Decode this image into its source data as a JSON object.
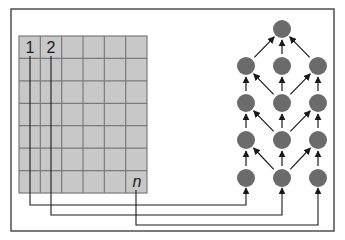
{
  "diagram": {
    "frame": {
      "x": 11,
      "y": 9,
      "w": 323,
      "h": 222,
      "stroke": "#333333"
    },
    "grid": {
      "x": 19,
      "y": 36,
      "w": 128,
      "h": 157,
      "cols": 6,
      "rows": 7,
      "fill": "#c8c8c8",
      "line_color": "#7a7a7a"
    },
    "labels": [
      {
        "text": "1",
        "x": 30,
        "y": 53,
        "italic": false
      },
      {
        "text": "2",
        "x": 51,
        "y": 53,
        "italic": false
      },
      {
        "text": "n",
        "x": 137,
        "y": 187,
        "italic": true
      }
    ],
    "node_color": "#6b6b6b",
    "node_radius": 9,
    "nodes": [
      {
        "id": "top",
        "x": 282,
        "y": 29
      },
      {
        "id": "r2c1",
        "x": 246,
        "y": 66
      },
      {
        "id": "r2c2",
        "x": 282,
        "y": 66
      },
      {
        "id": "r2c3",
        "x": 318,
        "y": 66
      },
      {
        "id": "r3c1",
        "x": 246,
        "y": 103
      },
      {
        "id": "r3c2",
        "x": 282,
        "y": 103
      },
      {
        "id": "r3c3",
        "x": 318,
        "y": 103
      },
      {
        "id": "r4c1",
        "x": 246,
        "y": 140
      },
      {
        "id": "r4c2",
        "x": 282,
        "y": 140
      },
      {
        "id": "r4c3",
        "x": 318,
        "y": 140
      },
      {
        "id": "r5c1",
        "x": 246,
        "y": 178
      },
      {
        "id": "r5c2",
        "x": 282,
        "y": 178
      },
      {
        "id": "r5c3",
        "x": 318,
        "y": 178
      }
    ],
    "edges": [
      {
        "from": "r2c1",
        "to": "top"
      },
      {
        "from": "r2c2",
        "to": "top"
      },
      {
        "from": "r2c3",
        "to": "top"
      },
      {
        "from": "r3c1",
        "to": "r2c1"
      },
      {
        "from": "r3c2",
        "to": "r2c2"
      },
      {
        "from": "r3c3",
        "to": "r2c3"
      },
      {
        "from": "r3c2",
        "to": "r2c1"
      },
      {
        "from": "r3c2",
        "to": "r2c3"
      },
      {
        "from": "r4c1",
        "to": "r3c1"
      },
      {
        "from": "r4c2",
        "to": "r3c2"
      },
      {
        "from": "r4c3",
        "to": "r3c3"
      },
      {
        "from": "r4c2",
        "to": "r3c1"
      },
      {
        "from": "r4c2",
        "to": "r3c3"
      },
      {
        "from": "r5c1",
        "to": "r4c1"
      },
      {
        "from": "r5c2",
        "to": "r4c2"
      },
      {
        "from": "r5c3",
        "to": "r4c3"
      },
      {
        "from": "r5c2",
        "to": "r4c1"
      },
      {
        "from": "r5c2",
        "to": "r4c3"
      }
    ],
    "connectors": [
      {
        "label": "1",
        "points": [
          [
            30,
            56
          ],
          [
            30,
            205
          ],
          [
            246,
            205
          ],
          [
            246,
            188
          ]
        ]
      },
      {
        "label": "2",
        "points": [
          [
            51,
            56
          ],
          [
            51,
            215
          ],
          [
            282,
            215
          ],
          [
            282,
            188
          ]
        ]
      },
      {
        "label": "n",
        "points": [
          [
            136,
            190
          ],
          [
            136,
            225
          ],
          [
            318,
            225
          ],
          [
            318,
            188
          ]
        ]
      }
    ]
  }
}
